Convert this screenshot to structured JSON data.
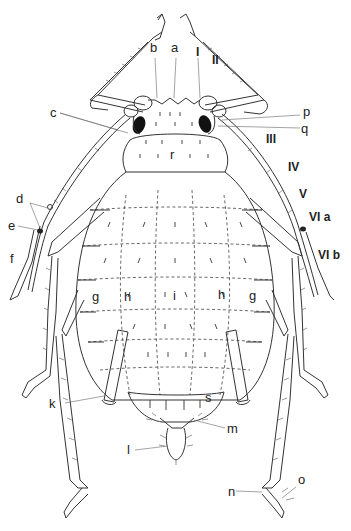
{
  "figure": {
    "colors": {
      "ink": "#222222",
      "background": "#ffffff"
    }
  },
  "labels": {
    "a": "a",
    "b": "b",
    "c": "c",
    "d": "d",
    "e": "e",
    "f": "f",
    "g_left": "g",
    "g_right": "g",
    "h_left": "h",
    "h_right": "h",
    "i": "i",
    "k": "k",
    "l": "l",
    "m": "m",
    "n": "n",
    "o": "o",
    "p": "p",
    "q": "q",
    "r": "r",
    "s": "s",
    "ant_I": "I",
    "ant_II": "II",
    "ant_III": "III",
    "ant_IV": "IV",
    "ant_V": "V",
    "ant_VIa": "VI a",
    "ant_VIb": "VI b"
  }
}
